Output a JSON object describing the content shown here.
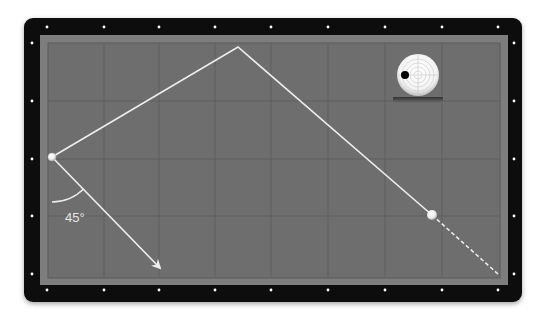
{
  "diagram": {
    "angle_label": "45°",
    "colors": {
      "frame": "#0d0d0d",
      "rail": "#7d7d7d",
      "cloth": "#6e6e6e",
      "grid": "#5e5e5e",
      "path": "#ededed",
      "diamond": "#ffffff",
      "cue_ball": "#f2f2f2",
      "object_ball": "#f2f2f2",
      "spin_marker": "#000000"
    },
    "table": {
      "outer": {
        "x": 24,
        "y": 18,
        "w": 498,
        "h": 284,
        "r": 9
      },
      "rail": {
        "x": 40,
        "y": 35,
        "w": 468,
        "h": 250
      },
      "cloth": {
        "x": 48,
        "y": 43,
        "w": 452,
        "h": 235
      },
      "grid_x": [
        104,
        159,
        215,
        271,
        328,
        385,
        442
      ],
      "grid_y": [
        101,
        159,
        216
      ],
      "diamonds_top": [
        [
          47,
          27
        ],
        [
          104,
          27
        ],
        [
          159,
          27
        ],
        [
          215,
          27
        ],
        [
          271,
          27
        ],
        [
          328,
          27
        ],
        [
          385,
          27
        ],
        [
          442,
          27
        ],
        [
          498,
          27
        ]
      ],
      "diamonds_bottom": [
        [
          47,
          290
        ],
        [
          104,
          290
        ],
        [
          159,
          290
        ],
        [
          215,
          290
        ],
        [
          271,
          290
        ],
        [
          328,
          290
        ],
        [
          385,
          290
        ],
        [
          442,
          290
        ],
        [
          498,
          290
        ]
      ],
      "diamonds_left": [
        [
          32,
          43
        ],
        [
          32,
          101
        ],
        [
          32,
          159
        ],
        [
          32,
          216
        ],
        [
          32,
          274
        ]
      ],
      "diamonds_right": [
        [
          514,
          43
        ],
        [
          514,
          101
        ],
        [
          514,
          159
        ],
        [
          514,
          216
        ],
        [
          514,
          274
        ]
      ]
    },
    "cue_ball": {
      "x": 52,
      "y": 157,
      "r": 4
    },
    "object_ball": {
      "x": 432,
      "y": 215,
      "r": 5
    },
    "path": {
      "solid": [
        [
          52,
          157
        ],
        [
          238,
          47
        ],
        [
          432,
          215
        ]
      ],
      "dashed": [
        [
          432,
          215
        ],
        [
          498,
          274
        ]
      ],
      "arrow": {
        "from": [
          52,
          157
        ],
        "to": [
          160,
          268
        ]
      }
    },
    "angle_arc": {
      "cx": 52,
      "cy": 157,
      "r": 45,
      "from_deg": 90,
      "to_deg": 45
    },
    "spin_indicator": {
      "ball": {
        "cx": 418,
        "cy": 75,
        "r": 21
      },
      "rings": [
        4,
        8,
        12,
        16
      ],
      "dot": {
        "cx": 405,
        "cy": 75,
        "r": 4
      },
      "shadow": {
        "x": 393,
        "y": 97,
        "w": 50,
        "h": 6
      }
    }
  }
}
